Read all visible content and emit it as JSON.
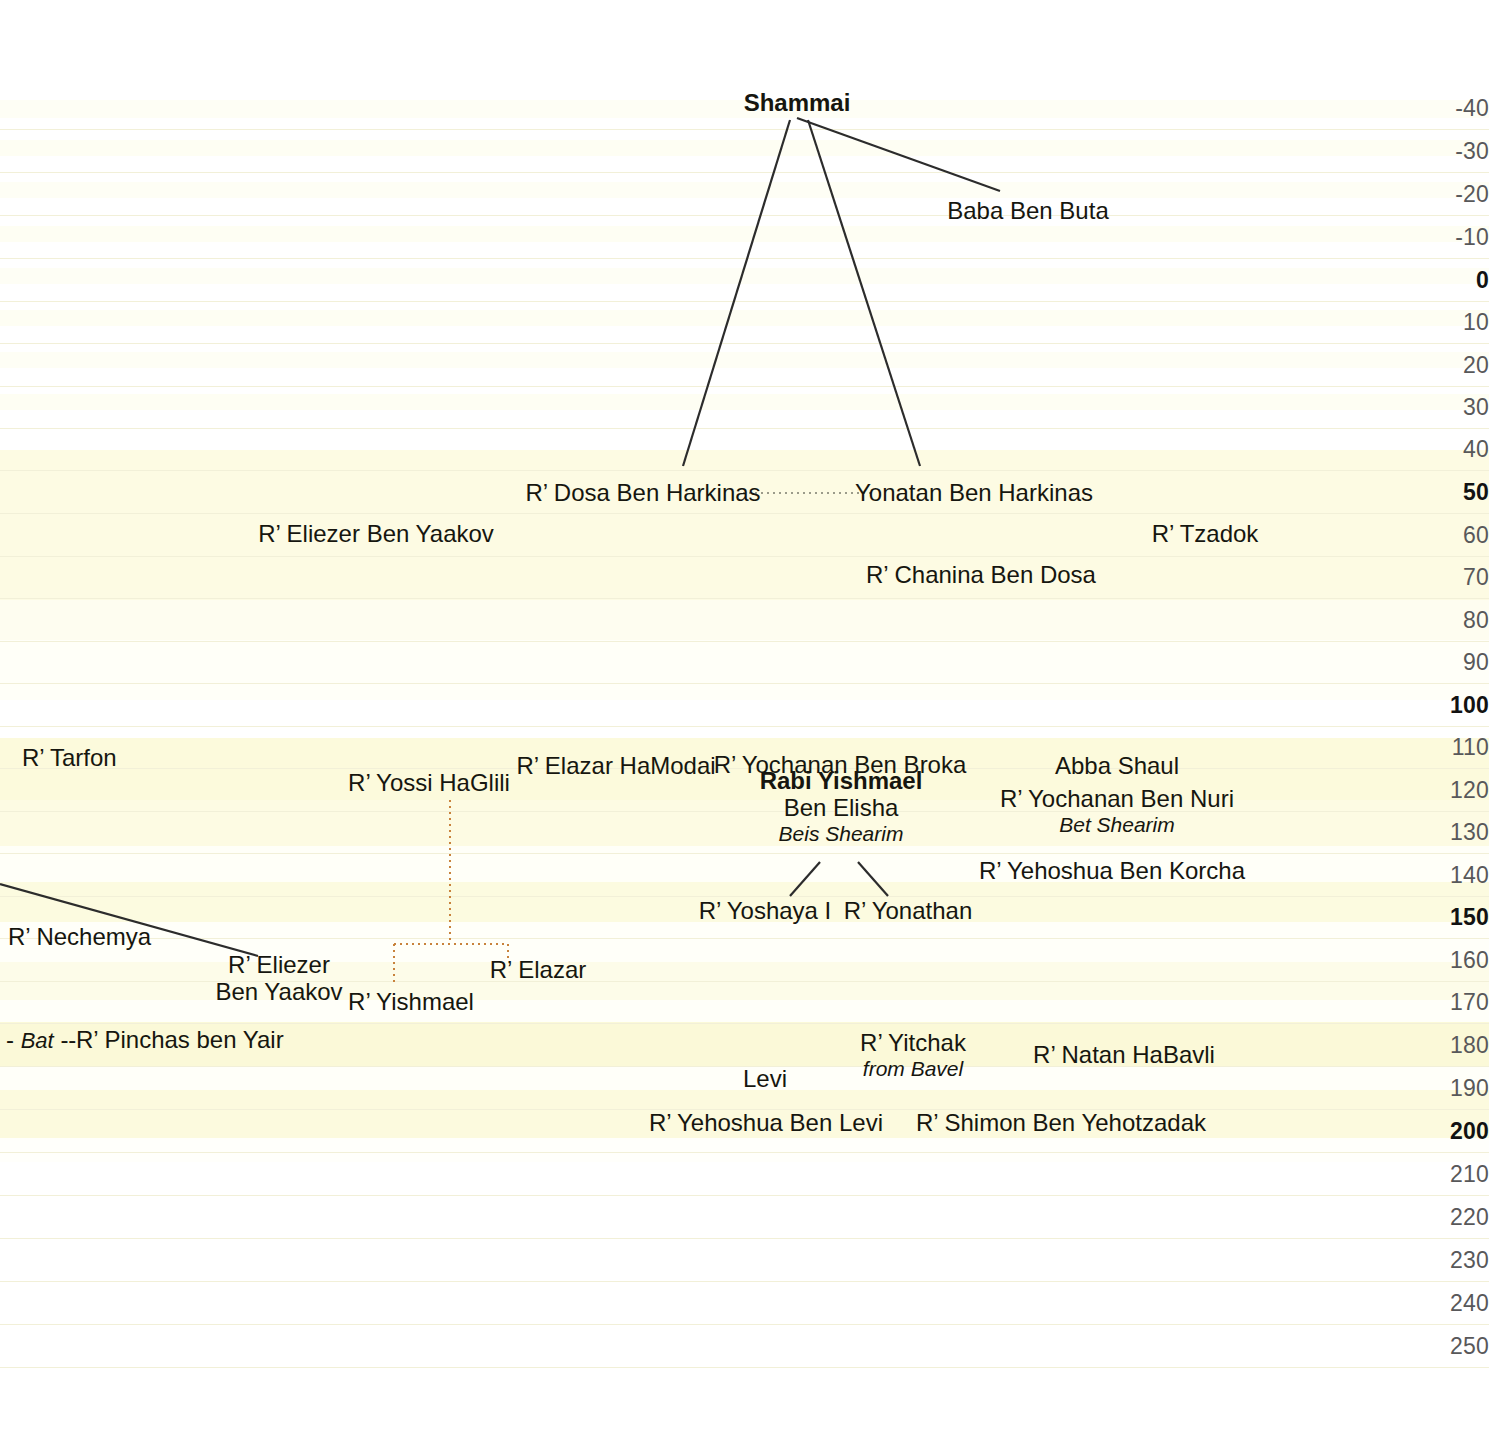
{
  "chart_data": {
    "type": "timeline-diagram",
    "xlabel": "",
    "ylabel": "Year (CE)",
    "axis_orientation": "vertical-right",
    "axis_ticks": [
      {
        "label": "-40",
        "year": -40,
        "y": 108,
        "major": false
      },
      {
        "label": "-30",
        "year": -30,
        "y": 151,
        "major": false
      },
      {
        "label": "-20",
        "year": -20,
        "y": 194,
        "major": false
      },
      {
        "label": "-10",
        "year": -10,
        "y": 237,
        "major": false
      },
      {
        "label": "0",
        "year": 0,
        "y": 280,
        "major": true
      },
      {
        "label": "10",
        "year": 10,
        "y": 322,
        "major": false
      },
      {
        "label": "20",
        "year": 20,
        "y": 365,
        "major": false
      },
      {
        "label": "30",
        "year": 30,
        "y": 407,
        "major": false
      },
      {
        "label": "40",
        "year": 40,
        "y": 449,
        "major": false
      },
      {
        "label": "50",
        "year": 50,
        "y": 492,
        "major": true
      },
      {
        "label": "60",
        "year": 60,
        "y": 535,
        "major": false
      },
      {
        "label": "70",
        "year": 70,
        "y": 577,
        "major": false
      },
      {
        "label": "80",
        "year": 80,
        "y": 620,
        "major": false
      },
      {
        "label": "90",
        "year": 90,
        "y": 662,
        "major": false
      },
      {
        "label": "100",
        "year": 100,
        "y": 705,
        "major": true
      },
      {
        "label": "110",
        "year": 110,
        "y": 747,
        "major": false
      },
      {
        "label": "120",
        "year": 120,
        "y": 790,
        "major": false
      },
      {
        "label": "130",
        "year": 130,
        "y": 832,
        "major": false
      },
      {
        "label": "140",
        "year": 140,
        "y": 875,
        "major": false
      },
      {
        "label": "150",
        "year": 150,
        "y": 917,
        "major": true
      },
      {
        "label": "160",
        "year": 160,
        "y": 960,
        "major": false
      },
      {
        "label": "170",
        "year": 170,
        "y": 1002,
        "major": false
      },
      {
        "label": "180",
        "year": 180,
        "y": 1045,
        "major": false
      },
      {
        "label": "190",
        "year": 190,
        "y": 1088,
        "major": false
      },
      {
        "label": "200",
        "year": 200,
        "y": 1131,
        "major": true
      },
      {
        "label": "210",
        "year": 210,
        "y": 1174,
        "major": false
      },
      {
        "label": "220",
        "year": 220,
        "y": 1217,
        "major": false
      },
      {
        "label": "230",
        "year": 230,
        "y": 1260,
        "major": false
      },
      {
        "label": "240",
        "year": 240,
        "y": 1303,
        "major": false
      },
      {
        "label": "250",
        "year": 250,
        "y": 1346,
        "major": false
      }
    ],
    "nodes": [
      {
        "id": "shammai",
        "label": "Shammai",
        "sub": "",
        "place": "",
        "bold": true,
        "x": 797,
        "y": 103,
        "align": "center",
        "year": -40
      },
      {
        "id": "baba-ben-buta",
        "label": "Baba Ben Buta",
        "sub": "",
        "place": "",
        "bold": false,
        "x": 1028,
        "y": 211,
        "align": "center",
        "year": -15
      },
      {
        "id": "dosa-ben-harkinas",
        "label": "R’ Dosa Ben Harkinas",
        "sub": "",
        "place": "",
        "bold": false,
        "x": 643,
        "y": 493,
        "align": "center",
        "year": 50
      },
      {
        "id": "yonatan-ben-harkinas",
        "label": "Yonatan Ben Harkinas",
        "sub": "",
        "place": "",
        "bold": false,
        "x": 974,
        "y": 493,
        "align": "center",
        "year": 50
      },
      {
        "id": "eliezer-ben-yaakov-1",
        "label": "R’ Eliezer Ben Yaakov",
        "sub": "",
        "place": "",
        "bold": false,
        "x": 376,
        "y": 534,
        "align": "center",
        "year": 60
      },
      {
        "id": "tzadok",
        "label": "R’ Tzadok",
        "sub": "",
        "place": "",
        "bold": false,
        "x": 1205,
        "y": 534,
        "align": "center",
        "year": 60
      },
      {
        "id": "chanina-ben-dosa",
        "label": "R’ Chanina Ben Dosa",
        "sub": "",
        "place": "",
        "bold": false,
        "x": 981,
        "y": 575,
        "align": "center",
        "year": 70
      },
      {
        "id": "tarfon",
        "label": "R’ Tarfon",
        "sub": "",
        "place": "",
        "bold": false,
        "x": 22,
        "y": 758,
        "align": "left",
        "year": 112
      },
      {
        "id": "elazar-hamodai",
        "label": "R’ Elazar HaModai",
        "sub": "",
        "place": "",
        "bold": false,
        "x": 616,
        "y": 766,
        "align": "center",
        "year": 114
      },
      {
        "id": "yochanan-ben-broka",
        "label": "R’ Yochanan Ben Broka",
        "sub": "",
        "place": "",
        "bold": false,
        "x": 840,
        "y": 765,
        "align": "center",
        "year": 114
      },
      {
        "id": "abba-shaul",
        "label": "Abba Shaul",
        "sub": "",
        "place": "",
        "bold": false,
        "x": 1117,
        "y": 766,
        "align": "center",
        "year": 114
      },
      {
        "id": "yossi-haglili",
        "label": "R’ Yossi HaGlili",
        "sub": "",
        "place": "",
        "bold": false,
        "x": 429,
        "y": 783,
        "align": "center",
        "year": 118
      },
      {
        "id": "rabi-yishmael-ben-elisha",
        "label": "Rabi Yishmael",
        "sub": "Ben Elisha",
        "place": "Beis Shearim",
        "bold": true,
        "x": 841,
        "y": 807,
        "align": "center",
        "year": 124
      },
      {
        "id": "yochanan-ben-nuri",
        "label": "R’ Yochanan Ben Nuri",
        "sub": "",
        "place": "Bet Shearim",
        "bold": false,
        "x": 1117,
        "y": 811,
        "align": "center",
        "year": 125
      },
      {
        "id": "yehoshua-ben-korcha",
        "label": "R’ Yehoshua Ben Korcha",
        "sub": "",
        "place": "",
        "bold": false,
        "x": 1112,
        "y": 871,
        "align": "center",
        "year": 139
      },
      {
        "id": "yoshaya-i",
        "label": "R’ Yoshaya I",
        "sub": "",
        "place": "",
        "bold": false,
        "x": 765,
        "y": 911,
        "align": "center",
        "year": 148
      },
      {
        "id": "yonathan",
        "label": "R’ Yonathan",
        "sub": "",
        "place": "",
        "bold": false,
        "x": 908,
        "y": 911,
        "align": "center",
        "year": 148
      },
      {
        "id": "nechemya",
        "label": "R’ Nechemya",
        "sub": "",
        "place": "",
        "bold": false,
        "x": 8,
        "y": 937,
        "align": "left",
        "year": 154
      },
      {
        "id": "eliezer-ben-yaakov-2",
        "label": "R’ Eliezer",
        "sub": "Ben Yaakov",
        "place": "",
        "bold": false,
        "x": 279,
        "y": 979,
        "align": "center",
        "year": 164
      },
      {
        "id": "elazar",
        "label": "R’ Elazar",
        "sub": "",
        "place": "",
        "bold": false,
        "x": 538,
        "y": 970,
        "align": "center",
        "year": 162
      },
      {
        "id": "yishmael",
        "label": "R’ Yishmael",
        "sub": "",
        "place": "",
        "bold": false,
        "x": 411,
        "y": 1002,
        "align": "center",
        "year": 170
      },
      {
        "id": "pinchas-ben-yair",
        "label": "R’ Pinchas ben Yair",
        "sub": "",
        "place": "",
        "bold": false,
        "x": 76,
        "y": 1040,
        "align": "left",
        "year": 179
      },
      {
        "id": "yitchak-from-bavel",
        "label": "R’ Yitchak",
        "sub": "",
        "place": "from Bavel",
        "bold": false,
        "x": 913,
        "y": 1055,
        "align": "center",
        "year": 182
      },
      {
        "id": "natan-habavli",
        "label": "R’ Natan HaBavli",
        "sub": "",
        "place": "",
        "bold": false,
        "x": 1124,
        "y": 1055,
        "align": "center",
        "year": 182
      },
      {
        "id": "levi",
        "label": "Levi",
        "sub": "",
        "place": "",
        "bold": false,
        "x": 765,
        "y": 1079,
        "align": "center",
        "year": 188
      },
      {
        "id": "yehoshua-ben-levi",
        "label": "R’ Yehoshua Ben Levi",
        "sub": "",
        "place": "",
        "bold": false,
        "x": 766,
        "y": 1123,
        "align": "center",
        "year": 198
      },
      {
        "id": "shimon-ben-yehotzadak",
        "label": "R’ Shimon Ben Yehotzadak",
        "sub": "",
        "place": "",
        "bold": false,
        "x": 1061,
        "y": 1123,
        "align": "center",
        "year": 198
      }
    ],
    "bat_marker": {
      "dash_left": "-",
      "italic": "Bat",
      "dash_right": "--"
    },
    "edges": [
      {
        "from": "shammai",
        "to": "baba-ben-buta",
        "style": "solid",
        "color": "#2c2c2c"
      },
      {
        "from": "shammai",
        "to": "dosa-ben-harkinas",
        "style": "solid",
        "color": "#2c2c2c"
      },
      {
        "from": "shammai",
        "to": "yonatan-ben-harkinas",
        "style": "solid",
        "color": "#2c2c2c"
      },
      {
        "from": "dosa-ben-harkinas",
        "to": "yonatan-ben-harkinas",
        "style": "dotted",
        "color": "#9b9b8a"
      },
      {
        "from": "rabi-yishmael-ben-elisha",
        "to": "yoshaya-i",
        "style": "solid",
        "color": "#2c2c2c"
      },
      {
        "from": "rabi-yishmael-ben-elisha",
        "to": "yonathan",
        "style": "solid",
        "color": "#2c2c2c"
      },
      {
        "from": "offscreen-left",
        "to": "eliezer-ben-yaakov-2",
        "style": "solid",
        "color": "#2c2c2c"
      },
      {
        "from": "yossi-haglili",
        "to": "yishmael",
        "style": "dotted-bracket",
        "color": "#c8823c"
      },
      {
        "from": "yossi-haglili",
        "to": "elazar",
        "style": "dotted-bracket",
        "color": "#c8823c"
      }
    ],
    "colors": {
      "band_light": "#fffff7",
      "band_cream": "#fdfbe4",
      "band_yellow": "#fcfadc",
      "gridline": "#f2f0d8",
      "axis_text": "#58585a",
      "axis_text_major": "#121212",
      "node_text": "#16160f",
      "edge_dark": "#2c2c2c",
      "edge_orange": "#c8823c",
      "edge_dotted_gray": "#9b9b8a",
      "background": "#ffffff"
    },
    "bands": [
      {
        "y": 100,
        "h": 18,
        "color": "#fefef5"
      },
      {
        "y": 140,
        "h": 16,
        "color": "#fefef3"
      },
      {
        "y": 182,
        "h": 16,
        "color": "#fefef5"
      },
      {
        "y": 226,
        "h": 16,
        "color": "#fefef3"
      },
      {
        "y": 268,
        "h": 16,
        "color": "#fefef5"
      },
      {
        "y": 310,
        "h": 16,
        "color": "#fefef3"
      },
      {
        "y": 352,
        "h": 16,
        "color": "#fefef5"
      },
      {
        "y": 394,
        "h": 16,
        "color": "#fefef3"
      },
      {
        "y": 450,
        "h": 150,
        "color": "#fdfbe3"
      },
      {
        "y": 600,
        "h": 40,
        "color": "#fefdf0"
      },
      {
        "y": 640,
        "h": 60,
        "color": "#fffff8"
      },
      {
        "y": 738,
        "h": 62,
        "color": "#fcfadc"
      },
      {
        "y": 800,
        "h": 46,
        "color": "#fdfbe3"
      },
      {
        "y": 846,
        "h": 36,
        "color": "#fffff8"
      },
      {
        "y": 882,
        "h": 40,
        "color": "#fcfbe0"
      },
      {
        "y": 922,
        "h": 40,
        "color": "#fffff9"
      },
      {
        "y": 962,
        "h": 38,
        "color": "#fdfce9"
      },
      {
        "y": 1000,
        "h": 22,
        "color": "#fffff9"
      },
      {
        "y": 1022,
        "h": 44,
        "color": "#fbf9d8"
      },
      {
        "y": 1066,
        "h": 24,
        "color": "#fffff9"
      },
      {
        "y": 1090,
        "h": 48,
        "color": "#fcfade"
      },
      {
        "y": 1138,
        "h": 24,
        "color": "#fffffb"
      }
    ]
  }
}
